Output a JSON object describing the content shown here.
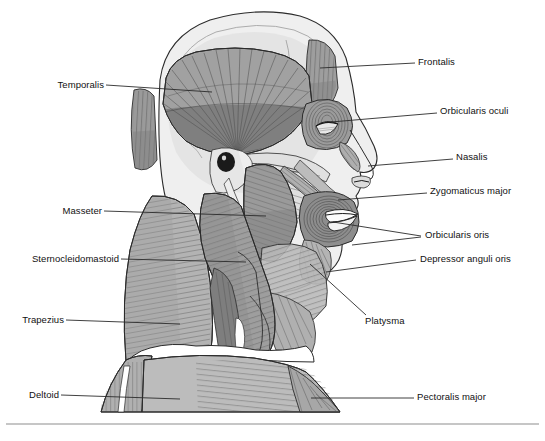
{
  "figure": {
    "background_color": "#ffffff",
    "line_color": "#2b2b2b",
    "label_color": "#111111"
  },
  "palette": {
    "skin": "#efefef",
    "skin_shadow": "#dcdcdc",
    "bone_light": "#e4e4e4",
    "bone_mid": "#cfcfcf",
    "muscle_light": "#c4c4c4",
    "muscle_mid": "#a6a6a6",
    "muscle_dark": "#8a8a8a",
    "muscle_darkest": "#6f6f6f",
    "stria": "#5d5d5d",
    "white": "#ffffff",
    "black": "#1a1a1a"
  },
  "labels": {
    "right": [
      {
        "id": "frontalis",
        "text": "Frontalis",
        "x": 418,
        "y": 62
      },
      {
        "id": "orbicularis-oculi",
        "text": "Orbicularis oculi",
        "x": 440,
        "y": 110
      },
      {
        "id": "nasalis",
        "text": "Nasalis",
        "x": 456,
        "y": 156
      },
      {
        "id": "zygomaticus-major",
        "text": "Zygomaticus major",
        "x": 430,
        "y": 190
      },
      {
        "id": "orbicularis-oris",
        "text": "Orbicularis oris",
        "x": 425,
        "y": 233
      },
      {
        "id": "depressor-anguli-oris",
        "text": "Depressor anguli oris",
        "x": 420,
        "y": 257
      },
      {
        "id": "platysma",
        "text": "Platysma",
        "x": 365,
        "y": 320
      },
      {
        "id": "pectoralis-major",
        "text": "Pectoralis major",
        "x": 417,
        "y": 394
      }
    ],
    "left": [
      {
        "id": "temporalis",
        "text": "Temporalis",
        "x": 47,
        "y": 82
      },
      {
        "id": "masseter",
        "text": "Masseter",
        "x": 56,
        "y": 208
      },
      {
        "id": "sternocleidomastoid",
        "text": "Sternocleidomastoid",
        "x": 10,
        "y": 256
      },
      {
        "id": "trapezius",
        "text": "Trapezius",
        "x": 14,
        "y": 317
      },
      {
        "id": "deltoid",
        "text": "Deltoid",
        "x": 25,
        "y": 392
      }
    ]
  },
  "leaders": [
    {
      "id": "leader-frontalis",
      "points": "320,68 415,63"
    },
    {
      "id": "leader-orbicularis-oculi",
      "points": "331,122 437,113"
    },
    {
      "id": "leader-nasalis",
      "points": "368,166 453,159"
    },
    {
      "id": "leader-zygomaticus-major",
      "points": "338,200 427,193"
    },
    {
      "id": "leader-orbicularis-oris-a",
      "points": "333,222 421,236"
    },
    {
      "id": "leader-orbicularis-oris-b",
      "points": "352,245 421,237"
    },
    {
      "id": "leader-depressor-anguli-oris",
      "points": "326,272 416,260"
    },
    {
      "id": "leader-platysma",
      "points": "310,264 366,315"
    },
    {
      "id": "leader-pectoralis-major",
      "points": "311,398 414,398"
    },
    {
      "id": "leader-temporalis",
      "points": "106,85 212,92"
    },
    {
      "id": "leader-masseter",
      "points": "104,211 266,216"
    },
    {
      "id": "leader-sternocleidomastoid",
      "points": "121,259 246,262"
    },
    {
      "id": "leader-trapezius",
      "points": "66,320 180,324"
    },
    {
      "id": "leader-deltoid",
      "points": "61,395 180,399"
    }
  ],
  "structures": [
    {
      "id": "cranium",
      "name": "cranium-scalp"
    },
    {
      "id": "temporalis-muscle",
      "name": "temporalis-muscle"
    },
    {
      "id": "frontalis-muscle",
      "name": "frontalis-muscle"
    },
    {
      "id": "occipital-muscle",
      "name": "occipital-belly"
    },
    {
      "id": "orbicularis-oculi-muscle",
      "name": "orbicularis-oculi-muscle"
    },
    {
      "id": "nasalis-muscle",
      "name": "nasalis-muscle"
    },
    {
      "id": "zygomaticus-muscle",
      "name": "zygomaticus-major-muscle"
    },
    {
      "id": "orbicularis-oris-muscle",
      "name": "orbicularis-oris-muscle"
    },
    {
      "id": "depressor-muscle",
      "name": "depressor-anguli-oris-muscle"
    },
    {
      "id": "masseter-muscle",
      "name": "masseter-muscle"
    },
    {
      "id": "buccinator-fan",
      "name": "buccinator-fan"
    },
    {
      "id": "sternocleidomastoid-muscle",
      "name": "sternocleidomastoid-muscle"
    },
    {
      "id": "trapezius-muscle",
      "name": "trapezius-muscle"
    },
    {
      "id": "platysma-sheet",
      "name": "platysma-sheet"
    },
    {
      "id": "deltoid-muscle",
      "name": "deltoid-muscle"
    },
    {
      "id": "pectoralis-muscle",
      "name": "pectoralis-major-muscle"
    },
    {
      "id": "ear-canal",
      "name": "external-auditory-meatus"
    },
    {
      "id": "mandible",
      "name": "mandible"
    }
  ],
  "rule": {
    "y": 424
  }
}
